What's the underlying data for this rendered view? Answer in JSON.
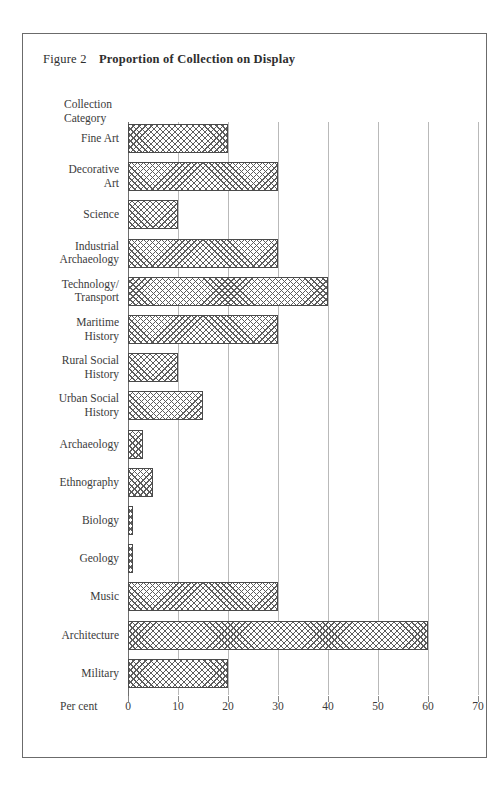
{
  "figure": {
    "number": "Figure 2",
    "title": "Proportion of Collection on Display"
  },
  "axes": {
    "y_axis_title_line1": "Collection",
    "y_axis_title_line2": "Category",
    "x_axis_title": "Per cent"
  },
  "colors": {
    "frame": "#6b6b6b",
    "gridline": "#b9b9b9",
    "bar_border": "#4a4a4a",
    "hatch": "#5d5d5d",
    "text": "#3b3b3b",
    "background": "#ffffff"
  },
  "chart_data": {
    "type": "bar",
    "orientation": "horizontal",
    "title": "Proportion of Collection on Display",
    "xlabel": "Per cent",
    "ylabel": "Collection Category",
    "xlim": [
      0,
      70
    ],
    "xticks": [
      0,
      10,
      20,
      30,
      40,
      50,
      60,
      70
    ],
    "xtick_labels": [
      "0",
      "10",
      "20",
      "30",
      "40",
      "50",
      "60",
      "70"
    ],
    "grid": true,
    "legend": "none",
    "categories": [
      "Fine Art",
      "Decorative Art",
      "Science",
      "Industrial Archaeology",
      "Technology/ Transport",
      "Maritime History",
      "Rural Social History",
      "Urban Social History",
      "Archaeology",
      "Ethnography",
      "Biology",
      "Geology",
      "Music",
      "Architecture",
      "Military"
    ],
    "values": [
      20,
      30,
      10,
      30,
      40,
      30,
      10,
      15,
      3,
      5,
      1,
      1,
      30,
      60,
      20
    ]
  },
  "bars": [
    {
      "label_line1": "Fine Art",
      "label_line2": "",
      "value": 20
    },
    {
      "label_line1": "Decorative",
      "label_line2": "Art",
      "value": 30
    },
    {
      "label_line1": "Science",
      "label_line2": "",
      "value": 10
    },
    {
      "label_line1": "Industrial",
      "label_line2": "Archaeology",
      "value": 30
    },
    {
      "label_line1": "Technology/",
      "label_line2": "Transport",
      "value": 40
    },
    {
      "label_line1": "Maritime",
      "label_line2": "History",
      "value": 30
    },
    {
      "label_line1": "Rural Social",
      "label_line2": "History",
      "value": 10
    },
    {
      "label_line1": "Urban Social",
      "label_line2": "History",
      "value": 15
    },
    {
      "label_line1": "Archaeology",
      "label_line2": "",
      "value": 3
    },
    {
      "label_line1": "Ethnography",
      "label_line2": "",
      "value": 5
    },
    {
      "label_line1": "Biology",
      "label_line2": "",
      "value": 1
    },
    {
      "label_line1": "Geology",
      "label_line2": "",
      "value": 1
    },
    {
      "label_line1": "Music",
      "label_line2": "",
      "value": 30
    },
    {
      "label_line1": "Architecture",
      "label_line2": "",
      "value": 60
    },
    {
      "label_line1": "Military",
      "label_line2": "",
      "value": 20
    }
  ]
}
